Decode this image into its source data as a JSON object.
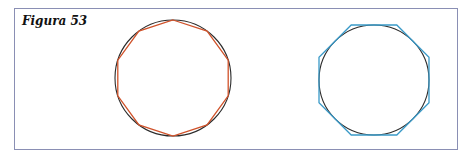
{
  "figure": {
    "title": "Figura 53",
    "frame_color": "#8a8fb4",
    "left": {
      "description": "circle with inscribed decagon",
      "circle": {
        "cx": 173,
        "cy": 78,
        "r": 58,
        "color": "#2b2b2b"
      },
      "polygon": {
        "sides": 10,
        "type": "inscribed",
        "color": "#d0522a",
        "rotation_deg": -90
      }
    },
    "right": {
      "description": "circle with circumscribed octagon",
      "circle": {
        "cx": 374,
        "cy": 80,
        "r": 55,
        "color": "#2b2b2b"
      },
      "polygon": {
        "sides": 8,
        "type": "circumscribed",
        "color": "#3a9ac8",
        "rotation_deg": 22.5
      }
    }
  }
}
